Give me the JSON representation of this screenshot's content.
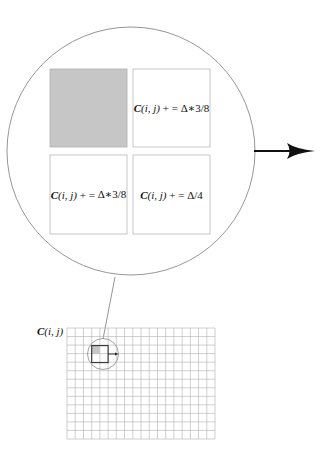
{
  "diagram": {
    "colors": {
      "background": "#ffffff",
      "shaded_cell": "#c6c6c6",
      "box_border": "#b8b8b8",
      "circle_stroke": "#8a8a8a",
      "grid_line": "#b0b0b0",
      "arrow": "#111111"
    },
    "zoom_circle": {
      "cells": [
        {
          "position": "top-left",
          "shaded": true,
          "label": null
        },
        {
          "position": "top-right",
          "shaded": false,
          "label": {
            "var": "C",
            "args": "(i, j)",
            "op": " + = ",
            "expr": "Δ∗3/8"
          }
        },
        {
          "position": "bottom-left",
          "shaded": false,
          "label": {
            "var": "C",
            "args": "(i, j)",
            "op": " + = ",
            "expr": "Δ∗3/8"
          }
        },
        {
          "position": "bottom-right",
          "shaded": false,
          "label": {
            "var": "C",
            "args": "(i, j)",
            "op": " + = ",
            "expr": "Δ/4"
          }
        }
      ],
      "arrow_direction": "right"
    },
    "grid": {
      "label": {
        "var": "C",
        "args": "(i, j)"
      },
      "columns": 18,
      "rows": 13,
      "highlight_cell_col": 3,
      "highlight_cell_row": 2
    }
  }
}
